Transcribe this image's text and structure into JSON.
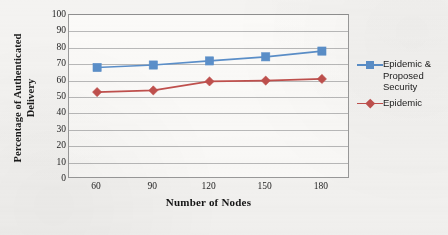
{
  "chart_data": {
    "type": "line",
    "title": "",
    "xlabel": "Number of Nodes",
    "ylabel": "Percentage of Authenticated Delivery",
    "ylabel_lines": [
      "Percentage of Authenticated",
      "Delivery"
    ],
    "categories": [
      60,
      90,
      120,
      150,
      180
    ],
    "x": [
      60,
      90,
      120,
      150,
      180
    ],
    "xticklabels": [
      "60",
      "90",
      "120",
      "150",
      "180"
    ],
    "yticklabels": [
      "0",
      "10",
      "20",
      "30",
      "40",
      "50",
      "60",
      "70",
      "80",
      "90",
      "100"
    ],
    "yticks": [
      0,
      10,
      20,
      30,
      40,
      50,
      60,
      70,
      80,
      90,
      100
    ],
    "ylim": [
      0,
      100
    ],
    "xlim": [
      45,
      195
    ],
    "grid": "horizontal",
    "legend_position": "right",
    "series": [
      {
        "name": "Epidemic & Proposed Security",
        "name_lines": [
          "Epidemic &",
          "Proposed",
          "Security"
        ],
        "color": "#5b8fc9",
        "marker": "square",
        "values": [
          68,
          69.5,
          72,
          74.5,
          78
        ]
      },
      {
        "name": "Epidemic",
        "name_lines": [
          "Epidemic"
        ],
        "color": "#c0504d",
        "marker": "diamond",
        "values": [
          53,
          54,
          59.5,
          60,
          61
        ]
      }
    ]
  },
  "colors": {
    "series_blue": "#5b8fc9",
    "series_red": "#c0504d",
    "gridline": "#b9b9b9",
    "plot_border": "#9a9a9a",
    "page_background": "#f4f3f1",
    "plot_background": "#fbfaf8",
    "text": "#1a1a1a"
  },
  "legend": {
    "entries": [
      {
        "label": "Epidemic & Proposed Security",
        "marker_name": "square-marker-icon"
      },
      {
        "label": "Epidemic",
        "marker_name": "diamond-marker-icon"
      }
    ]
  }
}
